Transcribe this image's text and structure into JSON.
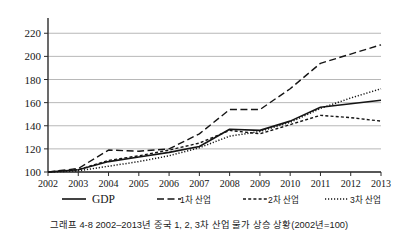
{
  "chart_data": {
    "type": "line",
    "title": "",
    "caption": "그래프 4-8 2002–2013년 중국 1, 2, 3차 산업 물가 상승 상황(2002년=100)",
    "xlabel": "",
    "ylabel": "",
    "x": [
      2002,
      2003,
      2004,
      2005,
      2006,
      2007,
      2008,
      2009,
      2010,
      2011,
      2012,
      2013
    ],
    "categories": [
      "2002",
      "2003",
      "2004",
      "2005",
      "2006",
      "2007",
      "2008",
      "2009",
      "2010",
      "2011",
      "2012",
      "2013"
    ],
    "ylim": [
      100,
      228
    ],
    "yticks": [
      100,
      120,
      140,
      160,
      180,
      200,
      220
    ],
    "ytick_labels": [
      "100",
      "120",
      "140",
      "160",
      "180",
      "200",
      "220"
    ],
    "grid": true,
    "legend_position": "bottom",
    "series": [
      {
        "name": "GDP",
        "style": "solid",
        "color": "#151515",
        "values": [
          100,
          102,
          109,
          113,
          117,
          122,
          137,
          136,
          144,
          156,
          159,
          162
        ]
      },
      {
        "name": "1차 산업",
        "style": "long-dash",
        "color": "#151515",
        "values": [
          100,
          103,
          119,
          118,
          120,
          133,
          154,
          154,
          172,
          194,
          202,
          210
        ]
      },
      {
        "name": "2차 산업",
        "style": "short-dash",
        "color": "#151515",
        "values": [
          100,
          102,
          110,
          114,
          119,
          125,
          136,
          133,
          141,
          149,
          147,
          144
        ]
      },
      {
        "name": "3차 산업",
        "style": "dotted",
        "color": "#151515",
        "values": [
          100,
          101,
          105,
          109,
          114,
          121,
          131,
          135,
          143,
          155,
          164,
          172
        ]
      }
    ]
  },
  "legend": {
    "items": [
      {
        "label": "GDP",
        "style": "solid"
      },
      {
        "label": "1차 산업",
        "style": "long-dash"
      },
      {
        "label": "2차 산업",
        "style": "short-dash"
      },
      {
        "label": "3차 산업",
        "style": "dotted"
      }
    ]
  }
}
